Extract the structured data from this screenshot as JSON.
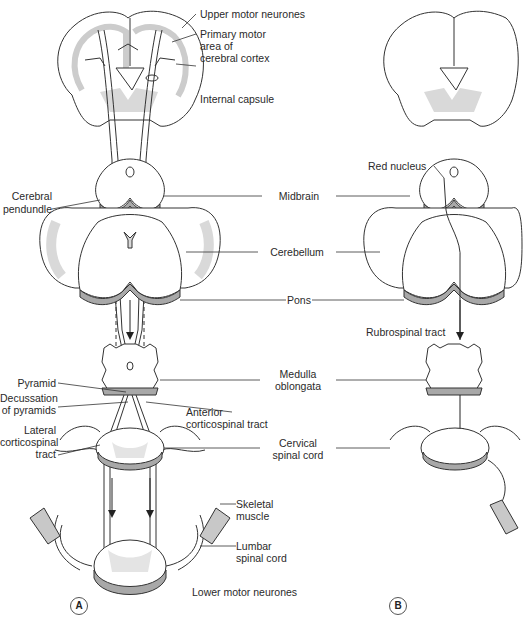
{
  "figure": {
    "panels": [
      {
        "id": "A",
        "label": "A",
        "description": "Corticospinal (pyramidal) pathway"
      },
      {
        "id": "B",
        "label": "B",
        "description": "Rubrospinal pathway"
      }
    ],
    "labels_panel_a_right": {
      "upper_motor_neurones": "Upper motor neurones",
      "primary_motor_area_1": "Primary motor",
      "primary_motor_area_2": "area of",
      "primary_motor_area_3": "cerebral cortex",
      "internal_capsule": "Internal capsule",
      "anterior_corticospinal_1": "Anterior",
      "anterior_corticospinal_2": "corticospinal tract",
      "skeletal_muscle_1": "Skeletal",
      "skeletal_muscle_2": "muscle",
      "lumbar_spinal_cord_1": "Lumbar",
      "lumbar_spinal_cord_2": "spinal cord",
      "lower_motor_neurones": "Lower motor neurones"
    },
    "labels_panel_a_left": {
      "cerebral_peduncle_1": "Cerebral",
      "cerebral_peduncle_2": "pendundle",
      "pyramid": "Pyramid",
      "decussation_1": "Decussation",
      "decussation_2": "of pyramids",
      "lateral_corticospinal_1": "Lateral",
      "lateral_corticospinal_2": "corticospinal",
      "lateral_corticospinal_3": "tract"
    },
    "labels_center": {
      "midbrain": "Midbrain",
      "cerebellum": "Cerebellum",
      "pons": "Pons",
      "medulla_1": "Medulla",
      "medulla_2": "oblongata",
      "cervical_1": "Cervical",
      "cervical_2": "spinal cord"
    },
    "labels_panel_b": {
      "red_nucleus": "Red nucleus",
      "rubrospinal_tract": "Rubrospinal tract"
    },
    "colors": {
      "outline": "#333333",
      "grey_matter": "#d9d9d9",
      "shading": "#a8a8a8",
      "background": "#ffffff"
    }
  }
}
